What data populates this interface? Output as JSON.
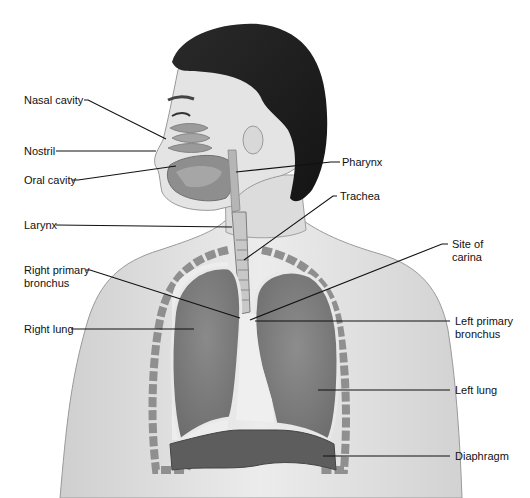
{
  "figure": {
    "labels_left": [
      {
        "id": "nasal-cavity",
        "text": "Nasal cavity"
      },
      {
        "id": "nostril",
        "text": "Nostril"
      },
      {
        "id": "oral-cavity",
        "text": "Oral cavity"
      },
      {
        "id": "larynx",
        "text": "Larynx"
      },
      {
        "id": "right-primary-bronchus",
        "line1": "Right primary",
        "line2": "bronchus"
      },
      {
        "id": "right-lung",
        "text": "Right lung"
      }
    ],
    "labels_right": [
      {
        "id": "pharynx",
        "text": "Pharynx"
      },
      {
        "id": "trachea",
        "text": "Trachea"
      },
      {
        "id": "site-of-carina",
        "line1": "Site of",
        "line2": "carina"
      },
      {
        "id": "left-primary-bronchus",
        "line1": "Left primary",
        "line2": "bronchus"
      },
      {
        "id": "left-lung",
        "text": "Left lung"
      },
      {
        "id": "diaphragm",
        "text": "Diaphragm"
      }
    ]
  }
}
